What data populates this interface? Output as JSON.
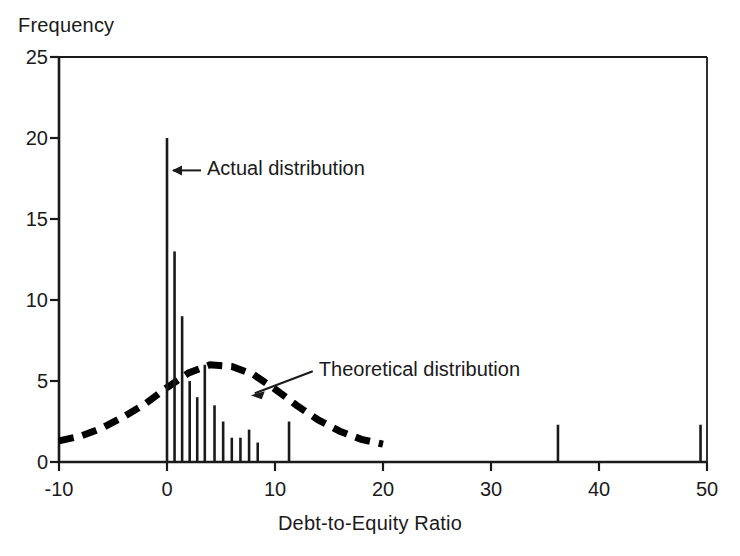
{
  "chart_data": {
    "type": "bar",
    "title": "",
    "xlabel": "Debt-to-Equity Ratio",
    "ylabel": "Frequency",
    "xlim": [
      -10,
      50
    ],
    "ylim": [
      0,
      25
    ],
    "grid": false,
    "legend_position": "inline-annotations",
    "xticks": [
      "-10",
      "0",
      "10",
      "20",
      "30",
      "40",
      "50"
    ],
    "xtick_values": [
      -10,
      0,
      10,
      20,
      30,
      40,
      50
    ],
    "yticks": [
      "0",
      "5",
      "10",
      "15",
      "20",
      "25"
    ],
    "ytick_values": [
      0,
      5,
      10,
      15,
      20,
      25
    ],
    "series": [
      {
        "name": "Actual distribution",
        "type": "bar",
        "x": [
          0.0,
          0.7,
          1.4,
          2.1,
          2.8,
          3.5,
          4.4,
          5.2,
          6.0,
          6.8,
          7.6,
          8.4,
          11.3,
          36.2,
          49.4
        ],
        "values": [
          20,
          13,
          9,
          5,
          4,
          6,
          3.5,
          2.5,
          1.5,
          1.5,
          2,
          1.2,
          2.5,
          2.3,
          2.3
        ]
      },
      {
        "name": "Theoretical distribution",
        "type": "line",
        "style": "dashed",
        "x": [
          -10,
          -8,
          -6,
          -4,
          -2,
          0,
          2,
          4,
          6,
          8,
          10,
          12,
          14,
          16,
          18,
          20
        ],
        "values": [
          1.3,
          1.6,
          2.1,
          2.8,
          3.6,
          4.6,
          5.5,
          6.0,
          5.9,
          5.4,
          4.5,
          3.5,
          2.6,
          1.9,
          1.4,
          1.1
        ]
      }
    ],
    "annotations": [
      {
        "text": "Actual distribution",
        "x": 0.0,
        "y": 18.0,
        "arrow": "left"
      },
      {
        "text": "Theoretical distribution",
        "x": 13.5,
        "y": 5.6,
        "arrow": "down-left"
      }
    ],
    "colors": {
      "axis": "#1a1a1a",
      "bar": "#1a1a1a",
      "curve": "#000000",
      "background": "#ffffff"
    }
  }
}
